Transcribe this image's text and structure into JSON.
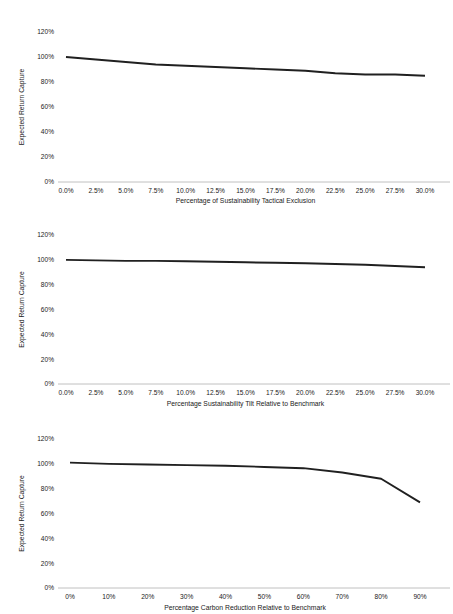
{
  "document": {
    "type": "figure-page",
    "background_color": "#ffffff",
    "line_color": "#202020",
    "axis_color": "#b9b9b9",
    "text_color": "#1a1a1a"
  },
  "chart_data": [
    {
      "id": "chart-1",
      "type": "line",
      "title": "",
      "xlabel": "Percentage of Sustainability Tactical Exclusion",
      "ylabel": "Expected Return Capture",
      "x": [
        0.0,
        2.5,
        5.0,
        7.5,
        10.0,
        12.5,
        15.0,
        17.5,
        20.0,
        22.5,
        25.0,
        27.5,
        30.0
      ],
      "xtick_labels": [
        "0.0%",
        "2.5%",
        "5.0%",
        "7.5%",
        "10.0%",
        "12.5%",
        "15.0%",
        "17.5%",
        "20.0%",
        "22.5%",
        "25.0%",
        "27.5%",
        "30.0%"
      ],
      "values": [
        100,
        98,
        96,
        94,
        93,
        92,
        91,
        90,
        89,
        87,
        86,
        86,
        85
      ],
      "ytick_labels": [
        "0%",
        "20%",
        "40%",
        "60%",
        "80%",
        "100%",
        "120%"
      ],
      "yticks": [
        0,
        20,
        40,
        60,
        80,
        100,
        120
      ],
      "xlim": [
        0.0,
        30.0
      ],
      "ylim": [
        0,
        120
      ],
      "grid": false,
      "legend": false
    },
    {
      "id": "chart-2",
      "type": "line",
      "title": "",
      "xlabel": "Percentage Sustainability Tilt Relative to Benchmark",
      "ylabel": "Expected Return Capture",
      "x": [
        0.0,
        2.5,
        5.0,
        7.5,
        10.0,
        12.5,
        15.0,
        17.5,
        20.0,
        22.5,
        25.0,
        27.5,
        30.0
      ],
      "xtick_labels": [
        "0.0%",
        "2.5%",
        "5.0%",
        "7.5%",
        "10.0%",
        "12.5%",
        "15.0%",
        "17.5%",
        "20.0%",
        "22.5%",
        "25.0%",
        "27.5%",
        "30.0%"
      ],
      "values": [
        100,
        99.6,
        99.2,
        99.2,
        98.8,
        98.4,
        98,
        97.6,
        97.2,
        96.6,
        96,
        95,
        94
      ],
      "ytick_labels": [
        "0%",
        "20%",
        "40%",
        "60%",
        "80%",
        "100%",
        "120%"
      ],
      "yticks": [
        0,
        20,
        40,
        60,
        80,
        100,
        120
      ],
      "xlim": [
        0.0,
        30.0
      ],
      "ylim": [
        0,
        120
      ],
      "grid": false,
      "legend": false
    },
    {
      "id": "chart-3",
      "type": "line",
      "title": "",
      "xlabel": "Percentage Carbon Reduction Relative to Benchmark",
      "ylabel": "Expected Return Capture",
      "x": [
        0,
        10,
        20,
        30,
        40,
        50,
        60,
        70,
        80,
        90
      ],
      "xtick_labels": [
        "0%",
        "10%",
        "20%",
        "30%",
        "40%",
        "50%",
        "60%",
        "70%",
        "80%",
        "90%"
      ],
      "values": [
        101,
        100,
        99.5,
        99,
        98.5,
        97.5,
        96.5,
        93,
        88,
        69
      ],
      "ytick_labels": [
        "0%",
        "20%",
        "40%",
        "60%",
        "80%",
        "100%",
        "120%"
      ],
      "yticks": [
        0,
        20,
        40,
        60,
        80,
        100,
        120
      ],
      "xlim": [
        0,
        90
      ],
      "ylim": [
        0,
        120
      ],
      "grid": false,
      "legend": false
    }
  ]
}
